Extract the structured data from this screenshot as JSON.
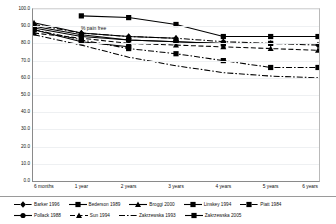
{
  "chart_data": {
    "type": "line",
    "title": "",
    "in_plot_label": "% pain free",
    "xlabel": "",
    "ylabel": "",
    "categories": [
      "6 months",
      "1 year",
      "2 years",
      "3 years",
      "4 years",
      "5 years",
      "6 years"
    ],
    "ylim": [
      0.0,
      100.0
    ],
    "yticks": [
      "0.0",
      "10.0",
      "20.0",
      "30.0",
      "40.0",
      "50.0",
      "60.0",
      "70.0",
      "80.0",
      "90.0",
      "100.0"
    ],
    "grid": true,
    "legend_position": "bottom",
    "series": [
      {
        "name": "Barker 1996",
        "marker": "diamond",
        "dash": "dashdot",
        "values": [
          91,
          86,
          84,
          83,
          81,
          80,
          79
        ]
      },
      {
        "name": "Bederson 1989",
        "marker": "square",
        "dash": "solid",
        "values": [
          88,
          81,
          78,
          null,
          null,
          null,
          null
        ]
      },
      {
        "name": "Broggi 2000",
        "marker": "triangle",
        "dash": "solid",
        "values": [
          92,
          86,
          84,
          83,
          null,
          null,
          null
        ]
      },
      {
        "name": "Linskey 1994",
        "marker": "square",
        "dash": "solid",
        "values": [
          null,
          96,
          95,
          91,
          84,
          84,
          84
        ]
      },
      {
        "name": "Piatt 1984",
        "marker": "square",
        "dash": "dashdot",
        "values": [
          88,
          82,
          77,
          74,
          70,
          66,
          66
        ]
      },
      {
        "name": "Pollack 1988",
        "marker": "circle",
        "dash": "solid",
        "values": [
          89,
          84,
          82,
          81,
          80,
          80,
          null
        ]
      },
      {
        "name": "Sun 1994",
        "marker": "triangle",
        "dash": "dashed",
        "values": [
          86,
          83,
          80,
          79,
          78,
          77,
          76
        ]
      },
      {
        "name": "Zakrzewska 1993",
        "marker": "none",
        "dash": "dashdot",
        "values": [
          85,
          79,
          72,
          67,
          63,
          61,
          60
        ]
      },
      {
        "name": "Zakrzewska 2005",
        "marker": "square",
        "dash": "solid",
        "values": [
          90,
          85,
          82,
          81,
          80,
          80,
          null
        ]
      }
    ]
  },
  "legend": {
    "rows": [
      [
        "Barker 1996",
        "Bederson 1989",
        "Broggi 2000",
        "Linskey 1994",
        "Piatt 1984"
      ],
      [
        "Pollack 1988",
        "Sun 1994",
        "Zakrzewska 1993",
        "Zakrzewska 2005"
      ]
    ]
  }
}
